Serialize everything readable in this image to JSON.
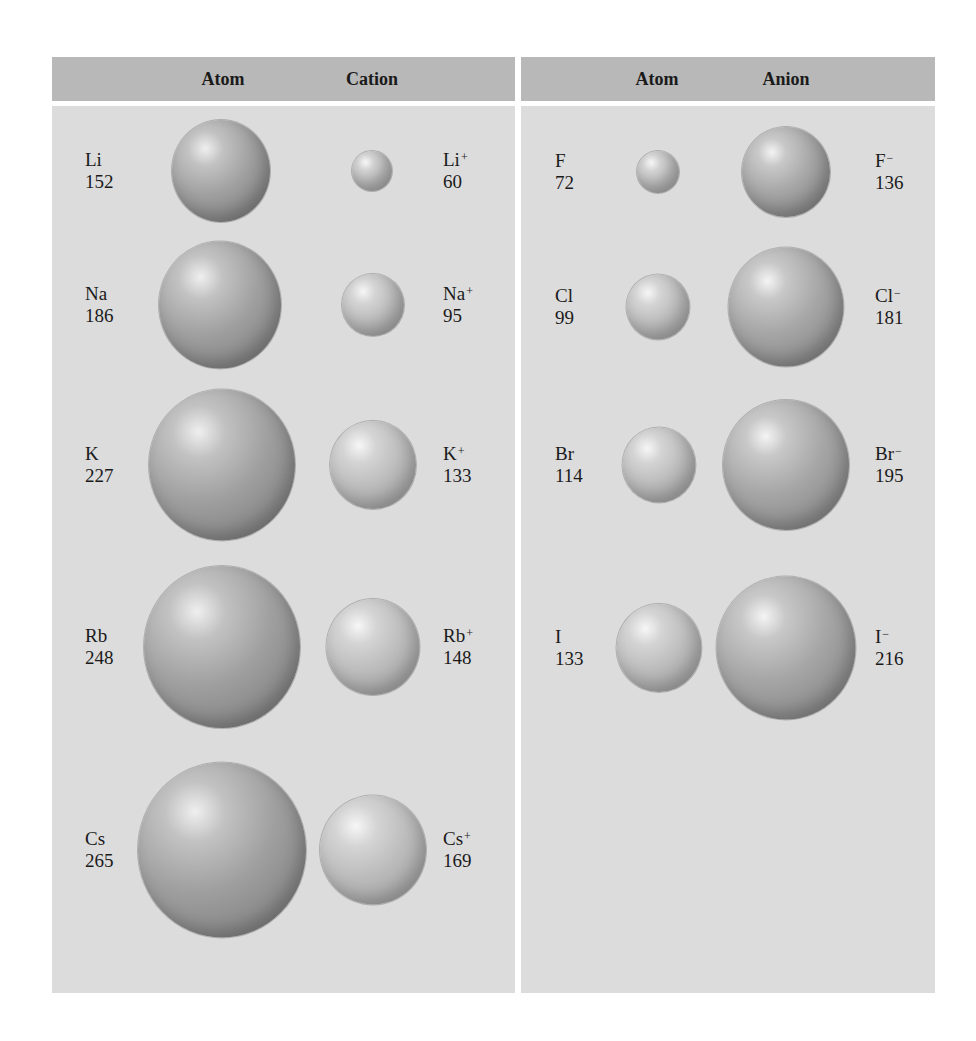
{
  "headers": {
    "left": {
      "atom": "Atom",
      "ion": "Cation"
    },
    "right": {
      "atom": "Atom",
      "ion": "Anion"
    }
  },
  "units_implied": "pm",
  "cations": [
    {
      "atom_symbol": "Li",
      "atom_radius": "152",
      "ion_symbol": "Li",
      "ion_charge": "+",
      "ion_radius": "60"
    },
    {
      "atom_symbol": "Na",
      "atom_radius": "186",
      "ion_symbol": "Na",
      "ion_charge": "+",
      "ion_radius": "95"
    },
    {
      "atom_symbol": "K",
      "atom_radius": "227",
      "ion_symbol": "K",
      "ion_charge": "+",
      "ion_radius": "133"
    },
    {
      "atom_symbol": "Rb",
      "atom_radius": "248",
      "ion_symbol": "Rb",
      "ion_charge": "+",
      "ion_radius": "148"
    },
    {
      "atom_symbol": "Cs",
      "atom_radius": "265",
      "ion_symbol": "Cs",
      "ion_charge": "+",
      "ion_radius": "169"
    }
  ],
  "anions": [
    {
      "atom_symbol": "F",
      "atom_radius": "72",
      "ion_symbol": "F",
      "ion_charge": "−",
      "ion_radius": "136"
    },
    {
      "atom_symbol": "Cl",
      "atom_radius": "99",
      "ion_symbol": "Cl",
      "ion_charge": "−",
      "ion_radius": "181"
    },
    {
      "atom_symbol": "Br",
      "atom_radius": "114",
      "ion_symbol": "Br",
      "ion_charge": "−",
      "ion_radius": "195"
    },
    {
      "atom_symbol": "I",
      "atom_radius": "133",
      "ion_symbol": "I",
      "ion_charge": "−",
      "ion_radius": "216"
    }
  ],
  "colors": {
    "header_bg": "#b8b8b8",
    "panel_bg": "#dcdcdc",
    "page_bg": "#ffffff"
  }
}
